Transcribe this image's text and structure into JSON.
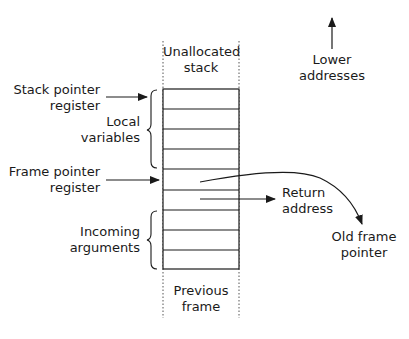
{
  "diagram": {
    "stack": {
      "top_label": [
        "Unallocated",
        "stack"
      ],
      "bottom_label": [
        "Previous",
        "frame"
      ],
      "slot_count": 9
    },
    "labels": {
      "stack_pointer": [
        "Stack pointer",
        "register"
      ],
      "frame_pointer": [
        "Frame pointer",
        "register"
      ],
      "local_variables": [
        "Local",
        "variables"
      ],
      "incoming_arguments": [
        "Incoming",
        "arguments"
      ],
      "return_address": [
        "Return",
        "address"
      ],
      "old_frame_pointer": [
        "Old frame",
        "pointer"
      ],
      "lower_addresses": [
        "Lower",
        "addresses"
      ]
    },
    "colors": {
      "ink": "#1a1a1a",
      "background": "#ffffff"
    }
  }
}
